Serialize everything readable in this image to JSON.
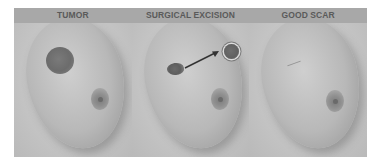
{
  "figure": {
    "panels": [
      {
        "label": "TUMOR",
        "content": "breast with dark round tumor in upper-left quadrant, nipple-areola at lower right"
      },
      {
        "label": "SURGICAL EXCISION",
        "content": "excision defect with arrow pointing to removed round specimen"
      },
      {
        "label": "GOOD SCAR",
        "content": "healed breast with faint scar, nipple-areola at lower right"
      }
    ],
    "colors": {
      "header_band": "#a8a8a8",
      "header_text": "#5a5a5a",
      "background": "#c9c9c9"
    }
  }
}
